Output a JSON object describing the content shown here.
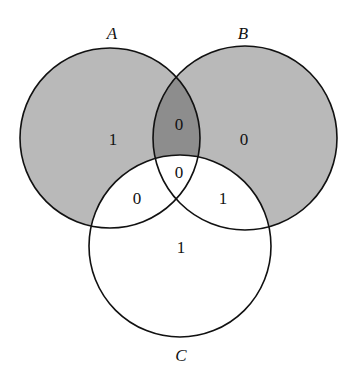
{
  "diagram": {
    "type": "venn-3",
    "colors": {
      "background": "#ffffff",
      "single_fill": "#b9b9b9",
      "overlap_fill": "#8d8d8d",
      "outline": "#111111"
    },
    "sets": [
      {
        "id": "A",
        "label": "A"
      },
      {
        "id": "B",
        "label": "B"
      },
      {
        "id": "C",
        "label": "C"
      }
    ],
    "regions": {
      "A_only": "1",
      "B_only": "0",
      "A_and_B_only": "0",
      "A_and_B_and_C": "0",
      "A_and_C_only": "0",
      "B_and_C_only": "1",
      "C_only": "1"
    },
    "shading": {
      "A_only": "light",
      "B_only": "light",
      "A_and_B_only": "dark",
      "C_regions": "none"
    }
  }
}
